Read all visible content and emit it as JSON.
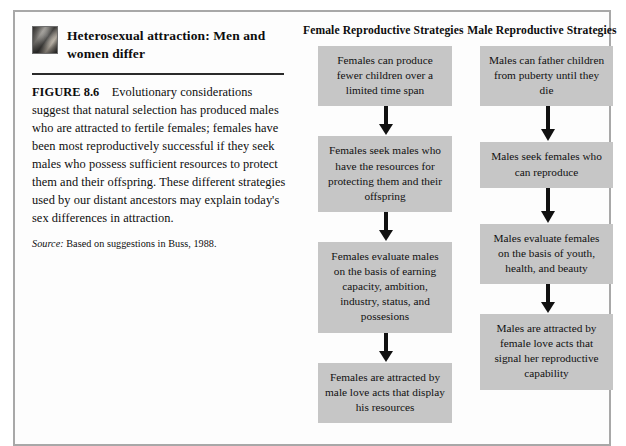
{
  "figure": {
    "thumb_icon": "photo-thumbnail-icon",
    "heading": "Heterosexual attraction: Men and women differ",
    "label": "FIGURE 8.6",
    "caption": "Evolutionary considerations suggest that natural selection has produced males who are attracted to fertile females; females have been most reproductively successful if they seek males who possess sufficient resources to protect them and their offspring. These different strategies used by our distant ancestors may explain today's sex differences in attraction.",
    "source_word": "Source:",
    "source_text": " Based on suggestions in Buss, 1988."
  },
  "colors": {
    "box_fill": "#c6c6c6",
    "frame_border": "#a8a8a8",
    "rule": "#2a2a2a",
    "text": "#111111"
  },
  "columns": [
    {
      "id": "female",
      "title": "Female Reproductive Strategies",
      "arrow_icon": "down-arrow-icon",
      "steps": [
        "Females can produce fewer children over a limited time span",
        "Females seek males who have the resources for protecting them and their offspring",
        "Females evaluate males on the basis of earning capacity, ambition, industry, status, and possesions",
        "Females are attracted by male love acts that display his resources"
      ]
    },
    {
      "id": "male",
      "title": "Male Reproductive Strategies",
      "arrow_icon": "down-arrow-icon",
      "steps": [
        "Males can father children from puberty until they die",
        "Males seek females who can reproduce",
        "Males evaluate females on the basis of youth, health, and beauty",
        "Males are attracted by female love acts that signal her reproductive capability"
      ]
    }
  ]
}
